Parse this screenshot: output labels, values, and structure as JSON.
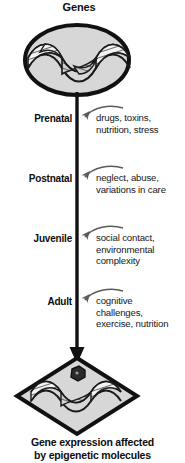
{
  "diagram": {
    "top_node": {
      "title": "Genes",
      "icon": "dna-double-helix"
    },
    "bottom_node": {
      "icon": "dna-double-helix-methylated",
      "caption_line1": "Gene expression affected",
      "caption_line2": "by epigenetic molecules"
    },
    "timeline": {
      "orientation": "vertical-downward-arrow",
      "stages": [
        {
          "label": "Prenatal",
          "factors_line1": "drugs, toxins,",
          "factors_line2": "nutrition, stress",
          "factors_line3": ""
        },
        {
          "label": "Postnatal",
          "factors_line1": "neglect, abuse,",
          "factors_line2": "variations in care",
          "factors_line3": ""
        },
        {
          "label": "Juvenile",
          "factors_line1": "social contact,",
          "factors_line2": "environmental",
          "factors_line3": "complexity"
        },
        {
          "label": "Adult",
          "factors_line1": "cognitive",
          "factors_line2": "challenges,",
          "factors_line3": "exercise, nutrition"
        }
      ]
    },
    "colors": {
      "stroke": "#111111",
      "node_fill": "#d7d7d7",
      "helix_fill": "#f2f2f2",
      "methyl_fill": "#2a2a2a",
      "arrow_gray": "#5a5a5a",
      "background": "#ffffff"
    }
  }
}
